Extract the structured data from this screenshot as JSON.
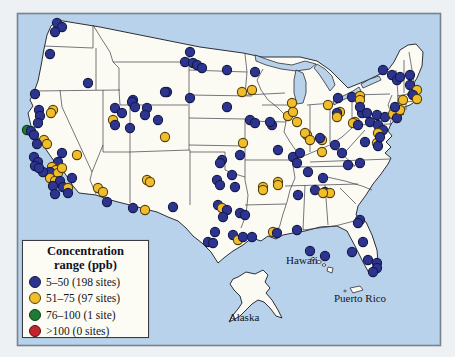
{
  "page": {
    "background": "#eef1f3"
  },
  "map": {
    "frame_color": "#76828e",
    "ocean_color": "#b7d2ea",
    "land_color": "#fcfbf3",
    "state_border_color": "#3c3c46",
    "labels": {
      "hawaii": "Hawaii",
      "alaska": "Alaska",
      "puerto_rico": "Puerto Rico"
    },
    "sites": [
      [
        57,
        23,
        "b"
      ],
      [
        62,
        27,
        "b"
      ],
      [
        55,
        32,
        "b"
      ],
      [
        50,
        54,
        "b"
      ],
      [
        88,
        83,
        "b"
      ],
      [
        115,
        108,
        "b"
      ],
      [
        133,
        100,
        "b"
      ],
      [
        147,
        108,
        "b"
      ],
      [
        35,
        94,
        "b"
      ],
      [
        39,
        110,
        "b"
      ],
      [
        53,
        110,
        "y"
      ],
      [
        40,
        116,
        "b"
      ],
      [
        51,
        113,
        "y"
      ],
      [
        38,
        123,
        "b"
      ],
      [
        27,
        130,
        "g"
      ],
      [
        31,
        131,
        "b"
      ],
      [
        34,
        135,
        "b"
      ],
      [
        44,
        140,
        "y"
      ],
      [
        37,
        144,
        "b"
      ],
      [
        47,
        144,
        "y"
      ],
      [
        62,
        153,
        "b"
      ],
      [
        34,
        157,
        "b"
      ],
      [
        38,
        162,
        "b"
      ],
      [
        35,
        166,
        "b"
      ],
      [
        58,
        162,
        "b"
      ],
      [
        52,
        167,
        "y"
      ],
      [
        56,
        170,
        "y"
      ],
      [
        50,
        172,
        "b"
      ],
      [
        58,
        173,
        "y"
      ],
      [
        62,
        168,
        "y"
      ],
      [
        50,
        178,
        "y"
      ],
      [
        55,
        181,
        "y"
      ],
      [
        43,
        172,
        "b"
      ],
      [
        39,
        168,
        "b"
      ],
      [
        60,
        181,
        "b"
      ],
      [
        53,
        186,
        "b"
      ],
      [
        63,
        187,
        "b"
      ],
      [
        68,
        188,
        "y"
      ],
      [
        68,
        193,
        "b"
      ],
      [
        72,
        178,
        "b"
      ],
      [
        55,
        194,
        "b"
      ],
      [
        77,
        155,
        "y"
      ],
      [
        98,
        188,
        "y"
      ],
      [
        103,
        192,
        "y"
      ],
      [
        107,
        202,
        "b"
      ],
      [
        147,
        180,
        "y"
      ],
      [
        150,
        182,
        "y"
      ],
      [
        145,
        210,
        "y"
      ],
      [
        133,
        208,
        "b"
      ],
      [
        173,
        207,
        "b"
      ],
      [
        113,
        120,
        "y"
      ],
      [
        115,
        125,
        "b"
      ],
      [
        122,
        113,
        "b"
      ],
      [
        130,
        128,
        "b"
      ],
      [
        132,
        102,
        "b"
      ],
      [
        135,
        107,
        "b"
      ],
      [
        167,
        92,
        "b"
      ],
      [
        190,
        98,
        "b"
      ],
      [
        145,
        115,
        "b"
      ],
      [
        158,
        120,
        "b"
      ],
      [
        165,
        137,
        "y"
      ],
      [
        190,
        52,
        "b"
      ],
      [
        185,
        62,
        "b"
      ],
      [
        193,
        63,
        "b"
      ],
      [
        197,
        65,
        "b"
      ],
      [
        202,
        68,
        "b"
      ],
      [
        227,
        70,
        "b"
      ],
      [
        255,
        72,
        "b"
      ],
      [
        165,
        92,
        "b"
      ],
      [
        227,
        107,
        "b"
      ],
      [
        250,
        120,
        "b"
      ],
      [
        272,
        125,
        "b"
      ],
      [
        252,
        90,
        "y"
      ],
      [
        242,
        92,
        "y"
      ],
      [
        292,
        103,
        "y"
      ],
      [
        288,
        116,
        "y"
      ],
      [
        297,
        122,
        "y"
      ],
      [
        270,
        122,
        "b"
      ],
      [
        255,
        123,
        "b"
      ],
      [
        307,
        135,
        "y"
      ],
      [
        322,
        140,
        "y"
      ],
      [
        293,
        112,
        "y"
      ],
      [
        328,
        105,
        "y"
      ],
      [
        338,
        98,
        "b"
      ],
      [
        340,
        112,
        "y"
      ],
      [
        337,
        113,
        "b"
      ],
      [
        243,
        143,
        "y"
      ],
      [
        240,
        155,
        "b"
      ],
      [
        278,
        150,
        "b"
      ],
      [
        293,
        157,
        "b"
      ],
      [
        222,
        160,
        "b"
      ],
      [
        220,
        163,
        "b"
      ],
      [
        232,
        175,
        "b"
      ],
      [
        217,
        180,
        "b"
      ],
      [
        263,
        187,
        "y"
      ],
      [
        278,
        182,
        "y"
      ],
      [
        220,
        185,
        "b"
      ],
      [
        235,
        187,
        "b"
      ],
      [
        352,
        97,
        "b"
      ],
      [
        360,
        96,
        "y"
      ],
      [
        362,
        113,
        "b"
      ],
      [
        355,
        122,
        "y"
      ],
      [
        370,
        122,
        "b"
      ],
      [
        365,
        142,
        "b"
      ],
      [
        305,
        133,
        "y"
      ],
      [
        310,
        140,
        "y"
      ],
      [
        320,
        138,
        "b"
      ],
      [
        322,
        152,
        "y"
      ],
      [
        335,
        145,
        "b"
      ],
      [
        342,
        153,
        "b"
      ],
      [
        300,
        153,
        "b"
      ],
      [
        297,
        163,
        "b"
      ],
      [
        308,
        172,
        "b"
      ],
      [
        323,
        178,
        "b"
      ],
      [
        348,
        165,
        "b"
      ],
      [
        360,
        163,
        "b"
      ],
      [
        337,
        117,
        "y"
      ],
      [
        367,
        113,
        "b"
      ],
      [
        377,
        115,
        "b"
      ],
      [
        385,
        117,
        "b"
      ],
      [
        393,
        114,
        "y"
      ],
      [
        397,
        118,
        "b"
      ],
      [
        353,
        123,
        "y"
      ],
      [
        358,
        125,
        "b"
      ],
      [
        378,
        125,
        "b"
      ],
      [
        383,
        130,
        "b"
      ],
      [
        378,
        133,
        "y"
      ],
      [
        377,
        143,
        "y"
      ],
      [
        378,
        146,
        "b"
      ],
      [
        380,
        137,
        "b"
      ],
      [
        360,
        100,
        "y"
      ],
      [
        360,
        107,
        "b"
      ],
      [
        383,
        70,
        "b"
      ],
      [
        392,
        75,
        "b"
      ],
      [
        397,
        80,
        "b"
      ],
      [
        400,
        77,
        "b"
      ],
      [
        410,
        75,
        "b"
      ],
      [
        410,
        85,
        "b"
      ],
      [
        417,
        90,
        "y"
      ],
      [
        413,
        95,
        "b"
      ],
      [
        417,
        99,
        "y"
      ],
      [
        403,
        100,
        "y"
      ],
      [
        400,
        110,
        "y"
      ],
      [
        395,
        107,
        "b"
      ],
      [
        325,
        192,
        "b"
      ],
      [
        330,
        193,
        "y"
      ],
      [
        298,
        195,
        "b"
      ],
      [
        315,
        190,
        "b"
      ],
      [
        323,
        193,
        "y"
      ],
      [
        218,
        205,
        "b"
      ],
      [
        222,
        208,
        "y"
      ],
      [
        227,
        210,
        "b"
      ],
      [
        223,
        217,
        "b"
      ],
      [
        240,
        213,
        "b"
      ],
      [
        245,
        215,
        "b"
      ],
      [
        215,
        232,
        "b"
      ],
      [
        208,
        242,
        "b"
      ],
      [
        213,
        243,
        "b"
      ],
      [
        233,
        235,
        "b"
      ],
      [
        238,
        240,
        "y"
      ],
      [
        243,
        237,
        "b"
      ],
      [
        252,
        237,
        "b"
      ],
      [
        263,
        190,
        "y"
      ],
      [
        278,
        185,
        "y"
      ],
      [
        273,
        232,
        "y"
      ],
      [
        277,
        233,
        "b"
      ],
      [
        297,
        230,
        "b"
      ],
      [
        360,
        220,
        "b"
      ],
      [
        358,
        223,
        "b"
      ],
      [
        363,
        242,
        "b"
      ],
      [
        352,
        252,
        "b"
      ],
      [
        368,
        260,
        "b"
      ],
      [
        377,
        263,
        "b"
      ],
      [
        377,
        268,
        "b"
      ],
      [
        373,
        272,
        "b"
      ],
      [
        310,
        251,
        "b"
      ],
      [
        325,
        256,
        "b"
      ]
    ]
  },
  "legend": {
    "title_line1": "Concentration",
    "title_line2": "range (ppb)",
    "entries": [
      {
        "key": "b",
        "label": "5–50 (198 sites)"
      },
      {
        "key": "y",
        "label": "51–75 (97 sites)"
      },
      {
        "key": "g",
        "label": "76–100 (1 site)"
      },
      {
        "key": "r",
        "label": ">100 (0 sites)"
      }
    ]
  },
  "dot_colors": {
    "b": {
      "fill": "#2c3490",
      "stroke": "#141a4a"
    },
    "y": {
      "fill": "#f2bd2b",
      "stroke": "#54400a"
    },
    "g": {
      "fill": "#1e7b33",
      "stroke": "#0a3c16"
    },
    "r": {
      "fill": "#c3242c",
      "stroke": "#5e0a10"
    }
  }
}
